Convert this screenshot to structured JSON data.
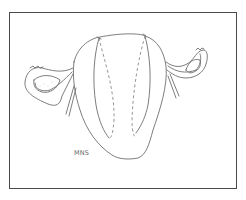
{
  "figure": {
    "signature": "MNS",
    "colors": {
      "line": "#6e6e6e",
      "frame": "#4a4a4a",
      "background": "#ffffff"
    }
  }
}
